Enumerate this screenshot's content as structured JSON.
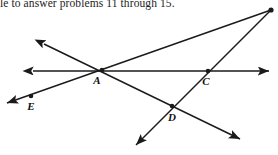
{
  "header": {
    "text": "le to answer problems 11 through 15."
  },
  "figure": {
    "name": "intersecting-lines-geometry-figure",
    "stroke_color": "#1a1a1a",
    "background_color": "#ffffff",
    "points": [
      {
        "id": "A",
        "label": "A",
        "x": 102,
        "y": 70,
        "label_x": 97,
        "label_y": 84,
        "marked": true
      },
      {
        "id": "C",
        "label": "C",
        "x": 208,
        "y": 71,
        "label_x": 206,
        "label_y": 85,
        "marked": true
      },
      {
        "id": "D",
        "label": "D",
        "x": 172,
        "y": 106,
        "label_x": 172,
        "label_y": 121,
        "marked": true
      },
      {
        "id": "E",
        "label": "E",
        "x": 31,
        "y": 96,
        "label_x": 31,
        "label_y": 110,
        "marked": true
      },
      {
        "id": "V",
        "label": "",
        "x": 271,
        "y": 10,
        "label_x": 0,
        "label_y": 0,
        "marked": true
      }
    ],
    "lines": [
      {
        "id": "horizontal-line",
        "name": "line-through-A-and-C",
        "x1": 33,
        "y1": 71,
        "x2": 269,
        "y2": 71,
        "arrow_start": true,
        "arrow_end": true
      },
      {
        "id": "line-vertex-to-E",
        "name": "line-through-vertex-A-E",
        "x1": 271,
        "y1": 10,
        "x2": 7,
        "y2": 103,
        "arrow_start": false,
        "arrow_end": true
      },
      {
        "id": "line-upper-left-to-lower-right",
        "name": "line-through-A-and-D",
        "x1": 44,
        "y1": 44,
        "x2": 240,
        "y2": 139,
        "arrow_start": true,
        "arrow_end": true
      },
      {
        "id": "line-vertex-through-C-D",
        "name": "line-through-vertex-C-D",
        "x1": 271,
        "y1": 10,
        "x2": 136,
        "y2": 145,
        "arrow_start": false,
        "arrow_end": true
      }
    ]
  }
}
